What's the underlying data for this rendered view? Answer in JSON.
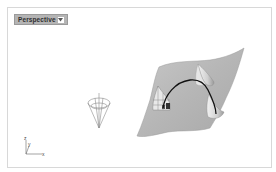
{
  "viewport": {
    "name": "Perspective",
    "menu_icon": "dropdown-arrow-icon"
  },
  "axis": {
    "x_label": "x",
    "y_label": "y",
    "z_label": "z"
  },
  "scene": {
    "objects": [
      "cone-wireframe",
      "nurbs-surface",
      "curve",
      "cone-peak-upper",
      "cone-peak-lower",
      "trimmed-cone-left"
    ]
  },
  "colors": {
    "background": "#ffffff",
    "tab_bg": "#b4b4b4",
    "surface": "#b8b8b8",
    "curve": "#111111",
    "wire": "#8a8a8a"
  }
}
